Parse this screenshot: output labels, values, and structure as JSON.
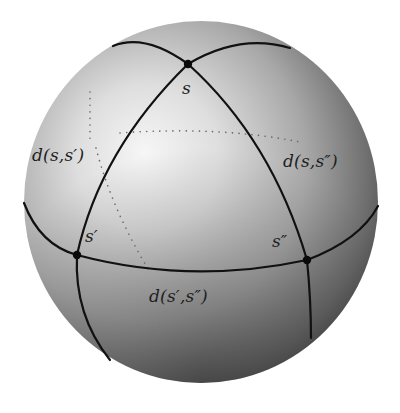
{
  "figure": {
    "type": "spherical-triangle-on-sphere",
    "colors": {
      "background": "#ffffff",
      "sphere_highlight": "#f4f4f4",
      "sphere_mid": "#b9b9b9",
      "sphere_shadow": "#4a4a4a",
      "lines": "#111111",
      "dotted": "#6a6a6a",
      "text": "#1e1e1e"
    },
    "sphere": {
      "cx": 201,
      "cy": 202,
      "r": 179
    },
    "vertices": [
      {
        "id": "s",
        "label": "s",
        "x": 188,
        "y": 64
      },
      {
        "id": "s1",
        "label": "s′",
        "x": 77,
        "y": 255
      },
      {
        "id": "s2",
        "label": "s″",
        "x": 307,
        "y": 260
      }
    ],
    "edges": [
      {
        "from": "s",
        "to": "s1",
        "label": "d(s,s′)"
      },
      {
        "from": "s",
        "to": "s2",
        "label": "d(s,s″)"
      },
      {
        "from": "s1",
        "to": "s2",
        "label": "d(s′,s″)"
      }
    ]
  },
  "labels": {
    "s": "s",
    "s_prime": "s′",
    "s_double_prime": "s″",
    "d_s_sprime": "d(s,s′)",
    "d_s_sdprime": "d(s,s″)",
    "d_sprime_sdprime": "d(s′,s″)"
  }
}
